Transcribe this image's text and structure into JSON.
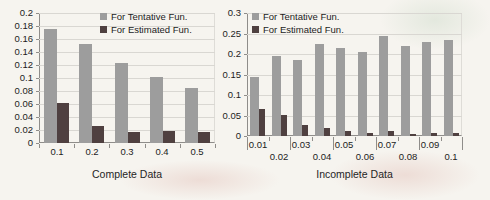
{
  "colors": {
    "tentative_bar": "#9d9d9d",
    "estimated_bar": "#4f4040",
    "gridline": "#d9d7d2",
    "axis": "#8f8d8a",
    "text": "#1c1c1c",
    "background": "#f6f4ef"
  },
  "legend": {
    "items": [
      {
        "label": "For Tentative Fun.",
        "color_key": "tentative_bar"
      },
      {
        "label": "For Estimated Fun.",
        "color_key": "estimated_bar"
      }
    ]
  },
  "chart_data": [
    {
      "type": "bar",
      "title": "",
      "xlabel": "Complete Data",
      "ylabel": "",
      "categories": [
        "0.1",
        "0.2",
        "0.3",
        "0.4",
        "0.5"
      ],
      "series": [
        {
          "name": "For Tentative Fun.",
          "values": [
            0.175,
            0.153,
            0.123,
            0.101,
            0.085
          ]
        },
        {
          "name": "For Estimated Fun.",
          "values": [
            0.062,
            0.026,
            0.017,
            0.018,
            0.017
          ]
        }
      ],
      "ylim": [
        0,
        0.2
      ],
      "yticks": [
        "0",
        "0.02",
        "0.04",
        "0.06",
        "0.08",
        "0.1",
        "0.12",
        "0.14",
        "0.16",
        "0.18",
        "0.2"
      ],
      "grid": true,
      "legend_position": "top-center-inside",
      "x_label_rows": 1
    },
    {
      "type": "bar",
      "title": "",
      "xlabel": "Incomplete Data",
      "ylabel": "",
      "categories": [
        "0.01",
        "0.02",
        "0.03",
        "0.04",
        "0.05",
        "0.06",
        "0.07",
        "0.08",
        "0.09",
        "0.1"
      ],
      "series": [
        {
          "name": "For Tentative Fun.",
          "values": [
            0.145,
            0.195,
            0.185,
            0.225,
            0.215,
            0.205,
            0.245,
            0.22,
            0.23,
            0.235
          ]
        },
        {
          "name": "For Estimated Fun.",
          "values": [
            0.065,
            0.05,
            0.027,
            0.02,
            0.013,
            0.007,
            0.012,
            0.006,
            0.007,
            0.008
          ]
        }
      ],
      "ylim": [
        0,
        0.3
      ],
      "yticks": [
        "0",
        "0.05",
        "0.1",
        "0.15",
        "0.2",
        "0.25",
        "0.3"
      ],
      "grid": true,
      "legend_position": "top-left-inside",
      "x_label_rows": 2
    }
  ]
}
